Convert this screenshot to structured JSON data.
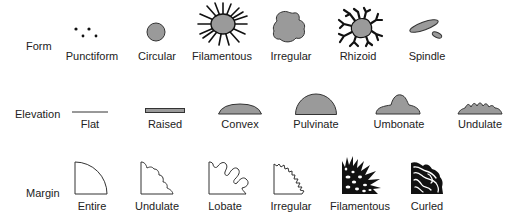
{
  "figure": {
    "fill_color": "#9a9a9a",
    "stroke_color": "#1a1a1a",
    "rows": [
      {
        "label": "Form",
        "items": [
          "Punctiform",
          "Circular",
          "Filamentous",
          "Irregular",
          "Rhizoid",
          "Spindle"
        ]
      },
      {
        "label": "Elevation",
        "items": [
          "Flat",
          "Raised",
          "Convex",
          "Pulvinate",
          "Umbonate",
          "Undulate"
        ]
      },
      {
        "label": "Margin",
        "items": [
          "Entire",
          "Undulate",
          "Lobate",
          "Irregular",
          "Filamentous",
          "Curled"
        ]
      }
    ]
  }
}
